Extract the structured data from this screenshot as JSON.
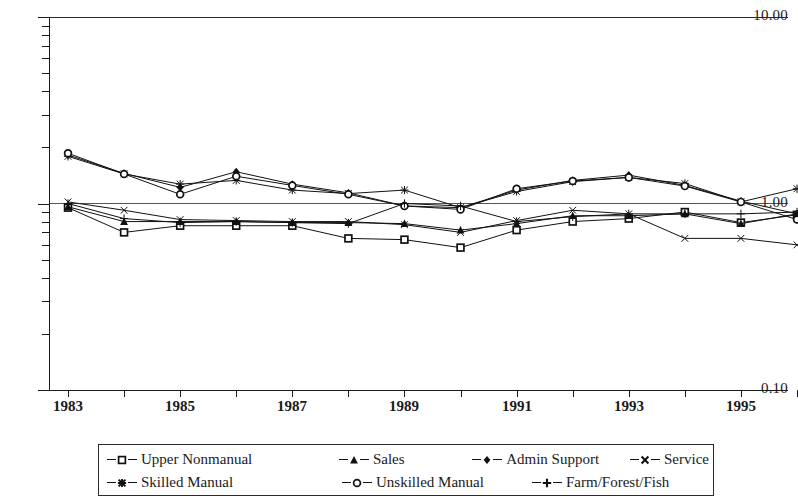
{
  "chart_data": {
    "type": "line",
    "title": "",
    "xlabel": "",
    "ylabel": "",
    "yscale": "log",
    "ylim": [
      0.1,
      10.0
    ],
    "xlim": [
      1983,
      1996
    ],
    "grid": false,
    "legend_position": "bottom",
    "ytick_labels": [
      "10.00",
      "1.00",
      "0.10"
    ],
    "ytick_values": [
      10.0,
      1.0,
      0.1
    ],
    "xtick_labels": [
      "1983",
      "1985",
      "1987",
      "1989",
      "1991",
      "1993",
      "1995"
    ],
    "xtick_values": [
      1983,
      1985,
      1987,
      1989,
      1991,
      1993,
      1995
    ],
    "x": [
      1983,
      1984,
      1985,
      1986,
      1987,
      1988,
      1989,
      1990,
      1991,
      1992,
      1993,
      1994,
      1995,
      1996
    ],
    "series": [
      {
        "name": "Upper Nonmanual",
        "marker": "square-open",
        "values": [
          0.95,
          0.7,
          0.76,
          0.76,
          0.76,
          0.65,
          0.64,
          0.58,
          0.72,
          0.8,
          0.83,
          0.9,
          0.79,
          0.87
        ]
      },
      {
        "name": "Sales",
        "marker": "triangle-filled",
        "values": [
          0.96,
          0.8,
          0.8,
          0.8,
          0.79,
          0.79,
          0.78,
          0.72,
          0.78,
          0.86,
          0.86,
          0.88,
          0.78,
          0.88
        ]
      },
      {
        "name": "Admin Support",
        "marker": "diamond-filled",
        "values": [
          1.82,
          1.45,
          1.22,
          1.48,
          1.27,
          1.14,
          0.97,
          0.95,
          1.18,
          1.33,
          1.42,
          1.25,
          1.03,
          0.88
        ]
      },
      {
        "name": "Service",
        "marker": "x-cross",
        "values": [
          1.02,
          0.92,
          0.82,
          0.81,
          0.8,
          0.8,
          0.77,
          0.7,
          0.81,
          0.92,
          0.88,
          0.65,
          0.65,
          0.6
        ]
      },
      {
        "name": "Skilled Manual",
        "marker": "star-burst",
        "values": [
          1.79,
          1.44,
          1.27,
          1.33,
          1.18,
          1.13,
          1.18,
          0.95,
          1.16,
          1.31,
          1.38,
          1.28,
          1.02,
          1.2
        ]
      },
      {
        "name": "Unskilled Manual",
        "marker": "circle-open",
        "values": [
          1.86,
          1.44,
          1.12,
          1.4,
          1.25,
          1.12,
          0.97,
          0.93,
          1.2,
          1.32,
          1.38,
          1.24,
          1.02,
          0.82
        ]
      },
      {
        "name": "Farm/Forest/Fish",
        "marker": "plus-cross",
        "values": [
          1.0,
          0.83,
          0.79,
          0.8,
          0.79,
          0.78,
          1.0,
          0.97,
          0.8,
          0.85,
          0.88,
          0.88,
          0.88,
          0.9
        ]
      }
    ]
  },
  "axes": {
    "y_labels": [
      "10.00",
      "1.00",
      "0.10"
    ],
    "x_labels": [
      "1983",
      "1985",
      "1987",
      "1989",
      "1991",
      "1993",
      "1995"
    ]
  },
  "legend": {
    "row1": [
      {
        "label": "Upper Nonmanual",
        "marker": "square-open"
      },
      {
        "label": "Sales",
        "marker": "triangle-filled"
      },
      {
        "label": "Admin Support",
        "marker": "diamond-filled"
      },
      {
        "label": "Service",
        "marker": "x-cross"
      }
    ],
    "row2": [
      {
        "label": "Skilled Manual",
        "marker": "star-burst"
      },
      {
        "label": "Unskilled Manual",
        "marker": "circle-open"
      },
      {
        "label": "Farm/Forest/Fish",
        "marker": "plus-cross"
      }
    ]
  }
}
